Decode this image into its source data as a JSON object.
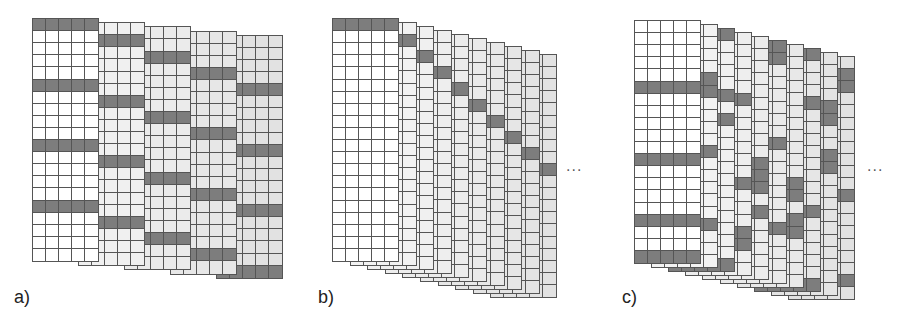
{
  "figure": {
    "colors": {
      "border": "#555555",
      "dark_cell": "#7d7d7d",
      "first_frame_fill": "#ffffff",
      "later_frame_fill_light": "#f4f4f4",
      "later_frame_fill_dark": "#e2e2e2"
    },
    "grid": {
      "rows": 20,
      "cols": 5,
      "cell_w": 13.4,
      "cell_h": 12.2
    },
    "panels": [
      {
        "id": "a",
        "label": "a)",
        "label_pos": [
          14,
          287
        ],
        "origin": [
          32,
          18
        ],
        "frame_dx": 46,
        "frame_dy": 4.2,
        "ellipsis": null,
        "frames": [
          {
            "dark_rows": [
              0,
              5,
              10,
              15
            ]
          },
          {
            "dark_rows": [
              1,
              6,
              11,
              16
            ]
          },
          {
            "dark_rows": [
              2,
              7,
              12,
              17
            ]
          },
          {
            "dark_rows": [
              3,
              8,
              13,
              18
            ]
          },
          {
            "dark_rows": [
              4,
              9,
              14,
              19
            ]
          }
        ]
      },
      {
        "id": "b",
        "label": "b)",
        "label_pos": [
          318,
          287
        ],
        "origin": [
          332,
          18
        ],
        "frame_dx": 17.6,
        "frame_dy": 4,
        "ellipsis": {
          "text": "...",
          "pos": [
            566,
            158
          ]
        },
        "frames": [
          {
            "dark_rows": [
              0
            ]
          },
          {
            "dark_rows": [
              1
            ]
          },
          {
            "dark_rows": [
              2
            ]
          },
          {
            "dark_rows": [
              3
            ]
          },
          {
            "dark_rows": [
              4
            ]
          },
          {
            "dark_rows": [
              5
            ]
          },
          {
            "dark_rows": [
              6
            ]
          },
          {
            "dark_rows": [
              7
            ]
          },
          {
            "dark_rows": [
              8
            ]
          },
          {
            "dark_rows": [
              9
            ]
          }
        ]
      },
      {
        "id": "c",
        "label": "c)",
        "label_pos": [
          622,
          287
        ],
        "origin": [
          634,
          20
        ],
        "frame_dx": 17.1,
        "frame_dy": 4,
        "ellipsis": {
          "text": "...",
          "pos": [
            867,
            158
          ]
        },
        "frames": [
          {
            "dark_rows": [
              5,
              11,
              16,
              19
            ]
          },
          {
            "dark_rows": [
              4,
              5,
              10,
              16
            ]
          },
          {
            "dark_rows": [
              0,
              5,
              7,
              19
            ]
          },
          {
            "dark_rows": [
              5,
              12,
              16,
              17
            ]
          },
          {
            "dark_rows": [
              10,
              11,
              12,
              14
            ]
          },
          {
            "dark_rows": [
              0,
              1,
              8,
              15
            ]
          },
          {
            "dark_rows": [
              11,
              12,
              14,
              15
            ]
          },
          {
            "dark_rows": [
              0,
              4,
              13,
              19
            ]
          },
          {
            "dark_rows": [
              4,
              5,
              8,
              9
            ]
          },
          {
            "dark_rows": [
              1,
              2,
              11,
              18
            ]
          }
        ]
      }
    ]
  }
}
